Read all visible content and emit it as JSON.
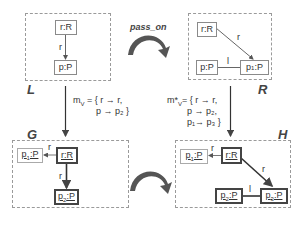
{
  "diagram": {
    "transformation_label": "pass_on",
    "panels": {
      "L": {
        "label": "L",
        "nodes": [
          {
            "id": "L_rR",
            "text": "r:R"
          },
          {
            "id": "L_pP",
            "text": "p:P"
          }
        ],
        "edges": [
          {
            "from": "r:R",
            "to": "p:P",
            "label": "r"
          }
        ]
      },
      "R": {
        "label": "R",
        "nodes": [
          {
            "id": "R_rR",
            "text": "r:R"
          },
          {
            "id": "R_pP",
            "text": "p:P"
          },
          {
            "id": "R_p1P",
            "text": "p",
            "sub": "1",
            "suffix": ":P"
          }
        ],
        "edges": [
          {
            "from": "r:R",
            "to": "p1:P",
            "label": "r"
          },
          {
            "from": "p:P",
            "to": "p1:P",
            "label": "l"
          }
        ]
      },
      "G": {
        "label": "G",
        "nodes": [
          {
            "id": "G_p1P",
            "text": "p",
            "sub": "1",
            "suffix": ":P"
          },
          {
            "id": "G_rR",
            "text": "r:R"
          },
          {
            "id": "G_p2P",
            "text": "p",
            "sub": "2",
            "suffix": ":P"
          }
        ],
        "edges": [
          {
            "from": "r:R",
            "to": "p1:P",
            "label": "r"
          },
          {
            "from": "r:R",
            "to": "p2:P",
            "label": "r"
          }
        ]
      },
      "H": {
        "label": "H",
        "nodes": [
          {
            "id": "H_p1P",
            "text": "p",
            "sub": "1",
            "suffix": ":P"
          },
          {
            "id": "H_rR",
            "text": "r:R"
          },
          {
            "id": "H_p2P",
            "text": "p",
            "sub": "2",
            "suffix": ":P"
          },
          {
            "id": "H_p3P",
            "text": "p",
            "sub": "3",
            "suffix": ":P"
          }
        ],
        "edges": [
          {
            "from": "r:R",
            "to": "p1:P",
            "label": "r"
          },
          {
            "from": "r:R",
            "to": "p3:P",
            "label": "r"
          },
          {
            "from": "p2:P",
            "to": "p3:P",
            "label": "l"
          }
        ]
      }
    },
    "matches": {
      "left": {
        "name": "m",
        "name_sub": "V",
        "lines": [
          "= { r → r,",
          "p → p₂ }"
        ]
      },
      "right": {
        "name": "m*",
        "name_sub": "V",
        "lines": [
          "= { r → r,",
          "p → p₂,",
          "p₁→ p₃ }"
        ]
      }
    },
    "edge_labels": {
      "r": "r",
      "l": "l"
    }
  }
}
